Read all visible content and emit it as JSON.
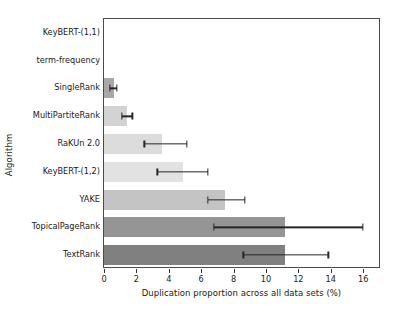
{
  "chart_data": {
    "type": "bar",
    "orientation": "horizontal",
    "title": "",
    "xlabel": "Duplication proportion across all data sets (%)",
    "ylabel": "Algorithm",
    "xlim": [
      0,
      17.1
    ],
    "xticks": [
      0,
      2,
      4,
      6,
      8,
      10,
      12,
      14,
      16
    ],
    "xtick_labels": [
      "0",
      "2",
      "4",
      "6",
      "8",
      "10",
      "12",
      "14",
      "16"
    ],
    "grid": false,
    "legend": null,
    "categories": [
      "KeyBERT-(1,1)",
      "term-frequency",
      "SingleRank",
      "MultiPartiteRank",
      "RaKUn 2.0",
      "KeyBERT-(1,2)",
      "YAKE",
      "TopicalPageRank",
      "TextRank"
    ],
    "values": [
      0.0,
      0.0,
      0.6,
      1.4,
      3.6,
      4.85,
      7.5,
      11.2,
      11.2
    ],
    "error_low": [
      0.0,
      0.0,
      0.35,
      1.1,
      2.5,
      3.3,
      6.4,
      6.8,
      8.6
    ],
    "error_high": [
      0.0,
      0.0,
      0.8,
      1.75,
      5.1,
      6.4,
      8.7,
      16.0,
      13.85
    ],
    "bar_colors": [
      "#9a9a9a",
      "#9a9a9a",
      "#a8a8a8",
      "#d3d3d3",
      "#dcdcdc",
      "#e2e2e2",
      "#c4c4c4",
      "#959595",
      "#808080"
    ],
    "error_color": "#262626"
  }
}
